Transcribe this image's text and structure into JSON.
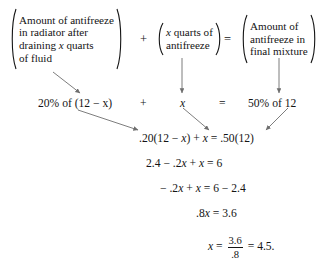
{
  "document": {
    "kind": "algebra-worked-example",
    "background_color": "#ffffff",
    "text_color": "#141414"
  },
  "word_equation": {
    "group1": {
      "lines": [
        "Amount of antifreeze",
        "in radiator after",
        "draining x quarts",
        "of fluid"
      ]
    },
    "operator1": "+",
    "group2": {
      "lines": [
        "x quarts of",
        "antifreeze"
      ]
    },
    "operator2": "=",
    "group3": {
      "lines": [
        "Amount of",
        "antifreeze in",
        "final mixture"
      ]
    }
  },
  "translation_row": {
    "term1": "20% of (12 − x)",
    "operator1": "+",
    "term2": "x",
    "operator2": "=",
    "term3": "50% of 12"
  },
  "solution_steps": [
    ".20(12 − x) + x = .50(12)",
    "2.4 − .2x + x = 6",
    "− .2x + x = 6 − 2.4",
    ".8x = 3.6"
  ],
  "final_step": {
    "lhs": "x",
    "equals1": "=",
    "numerator": "3.6",
    "denominator": ".8",
    "equals2": "=",
    "result": "4.5."
  },
  "arrows": {
    "color": "#6e6e6e",
    "items": [
      {
        "name": "arrow-group1-to-term1",
        "x1": 53,
        "y1": 72,
        "x2": 80,
        "y2": 93
      },
      {
        "name": "arrow-group2-to-term2",
        "x1": 182,
        "y1": 58,
        "x2": 182,
        "y2": 93
      },
      {
        "name": "arrow-group3-to-term3",
        "x1": 279,
        "y1": 58,
        "x2": 279,
        "y2": 93
      },
      {
        "name": "arrow-term1-to-step1",
        "x1": 78,
        "y1": 110,
        "x2": 138,
        "y2": 130
      },
      {
        "name": "arrow-term2-to-step1",
        "x1": 183,
        "y1": 108,
        "x2": 209,
        "y2": 130
      },
      {
        "name": "arrow-term3-to-step1",
        "x1": 288,
        "y1": 108,
        "x2": 266,
        "y2": 130
      }
    ]
  }
}
